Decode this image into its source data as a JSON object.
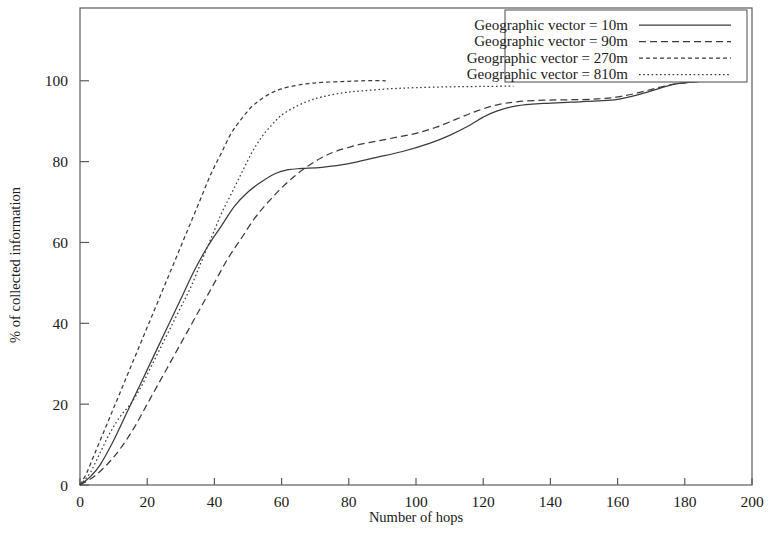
{
  "chart_data": {
    "type": "line",
    "title": "",
    "xlabel": "Number of hops",
    "ylabel": "% of collected information",
    "xlim": [
      0,
      200
    ],
    "ylim": [
      0,
      118
    ],
    "xticks": [
      0,
      20,
      40,
      60,
      80,
      100,
      120,
      140,
      160,
      180,
      200
    ],
    "yticks": [
      0,
      20,
      40,
      60,
      80,
      100
    ],
    "xticklabels": [
      "0",
      "20",
      "40",
      "60",
      "80",
      "100",
      "120",
      "140",
      "160",
      "180",
      "200"
    ],
    "yticklabels": [
      "0",
      "20",
      "40",
      "60",
      "80",
      "100"
    ],
    "grid": false,
    "legend_position": "top-right",
    "series": [
      {
        "name": "Geographic vector = 10m",
        "dash_style": "solid",
        "dasharray": "none",
        "color": "#3b3b3b",
        "points": [
          [
            0,
            0
          ],
          [
            3,
            2
          ],
          [
            6,
            5
          ],
          [
            10,
            11
          ],
          [
            14,
            18
          ],
          [
            18,
            25
          ],
          [
            22,
            32
          ],
          [
            26,
            39
          ],
          [
            30,
            46
          ],
          [
            34,
            53
          ],
          [
            38,
            59
          ],
          [
            42,
            64
          ],
          [
            46,
            69
          ],
          [
            50,
            72.5
          ],
          [
            54,
            75
          ],
          [
            58,
            77
          ],
          [
            62,
            78
          ],
          [
            66,
            78.3
          ],
          [
            72,
            78.6
          ],
          [
            80,
            79.5
          ],
          [
            88,
            81
          ],
          [
            96,
            82.5
          ],
          [
            104,
            84.5
          ],
          [
            110,
            86.5
          ],
          [
            116,
            89
          ],
          [
            120,
            91
          ],
          [
            124,
            92.5
          ],
          [
            130,
            93.8
          ],
          [
            138,
            94.4
          ],
          [
            146,
            94.7
          ],
          [
            154,
            95
          ],
          [
            160,
            95.4
          ],
          [
            166,
            96.5
          ],
          [
            172,
            98
          ],
          [
            176,
            99
          ],
          [
            180,
            99.5
          ],
          [
            184,
            99.8
          ],
          [
            188,
            100
          ]
        ]
      },
      {
        "name": "Geographic vector = 90m",
        "dash_style": "dashed",
        "dasharray": "7,4",
        "color": "#3b3b3b",
        "points": [
          [
            0,
            0
          ],
          [
            4,
            2
          ],
          [
            8,
            5
          ],
          [
            12,
            9
          ],
          [
            16,
            14
          ],
          [
            20,
            20
          ],
          [
            24,
            26
          ],
          [
            28,
            32
          ],
          [
            32,
            38
          ],
          [
            36,
            44
          ],
          [
            40,
            50
          ],
          [
            44,
            56
          ],
          [
            48,
            61
          ],
          [
            52,
            66
          ],
          [
            56,
            70
          ],
          [
            60,
            73.5
          ],
          [
            64,
            76.5
          ],
          [
            68,
            79
          ],
          [
            72,
            81
          ],
          [
            76,
            82.5
          ],
          [
            82,
            84
          ],
          [
            88,
            85
          ],
          [
            94,
            86
          ],
          [
            100,
            87
          ],
          [
            106,
            88.5
          ],
          [
            112,
            90.5
          ],
          [
            118,
            92.5
          ],
          [
            124,
            94
          ],
          [
            130,
            94.8
          ],
          [
            138,
            95.2
          ],
          [
            146,
            95.3
          ],
          [
            154,
            95.5
          ],
          [
            160,
            96
          ],
          [
            166,
            97
          ],
          [
            172,
            98.3
          ],
          [
            178,
            99.3
          ],
          [
            184,
            99.8
          ],
          [
            188,
            100
          ]
        ]
      },
      {
        "name": "Geographic vector = 270m",
        "dash_style": "fine-dashed",
        "dasharray": "4,3",
        "color": "#3b3b3b",
        "points": [
          [
            0,
            0
          ],
          [
            2,
            3
          ],
          [
            4,
            7
          ],
          [
            6,
            11
          ],
          [
            9,
            17
          ],
          [
            12,
            23
          ],
          [
            15,
            29
          ],
          [
            18,
            35
          ],
          [
            21,
            41
          ],
          [
            24,
            47
          ],
          [
            27,
            53
          ],
          [
            30,
            59
          ],
          [
            33,
            65
          ],
          [
            36,
            71
          ],
          [
            39,
            77
          ],
          [
            42,
            82
          ],
          [
            45,
            87
          ],
          [
            48,
            90.5
          ],
          [
            51,
            93.5
          ],
          [
            54,
            95.5
          ],
          [
            57,
            97
          ],
          [
            60,
            98
          ],
          [
            64,
            98.8
          ],
          [
            68,
            99.3
          ],
          [
            72,
            99.6
          ],
          [
            78,
            99.8
          ],
          [
            84,
            100
          ],
          [
            91,
            100
          ]
        ]
      },
      {
        "name": "Geographic vector = 810m",
        "dash_style": "dotted",
        "dasharray": "1.6,2.6",
        "color": "#3b3b3b",
        "points": [
          [
            0,
            0
          ],
          [
            3,
            3
          ],
          [
            6,
            8
          ],
          [
            9,
            13
          ],
          [
            12,
            17
          ],
          [
            15,
            20
          ],
          [
            18,
            24
          ],
          [
            21,
            29
          ],
          [
            24,
            34
          ],
          [
            27,
            39
          ],
          [
            30,
            44
          ],
          [
            33,
            49
          ],
          [
            36,
            55
          ],
          [
            39,
            61
          ],
          [
            42,
            67
          ],
          [
            45,
            72
          ],
          [
            48,
            77
          ],
          [
            51,
            82
          ],
          [
            54,
            86
          ],
          [
            57,
            89
          ],
          [
            60,
            91.5
          ],
          [
            64,
            93.5
          ],
          [
            68,
            95
          ],
          [
            72,
            96
          ],
          [
            78,
            97
          ],
          [
            84,
            97.5
          ],
          [
            92,
            98
          ],
          [
            100,
            98.3
          ],
          [
            110,
            98.5
          ],
          [
            120,
            98.6
          ],
          [
            129,
            98.7
          ]
        ]
      }
    ]
  },
  "legend": {
    "entries": [
      {
        "label": "Geographic vector = 10m"
      },
      {
        "label": "Geographic vector = 90m"
      },
      {
        "label": "Geographic vector = 270m"
      },
      {
        "label": "Geographic vector = 810m"
      }
    ]
  }
}
